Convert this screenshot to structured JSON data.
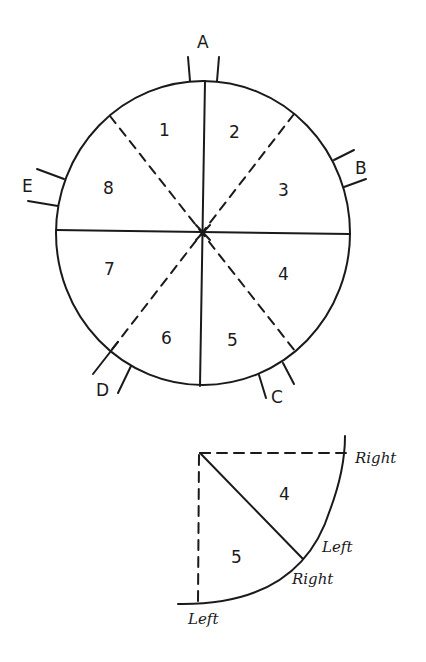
{
  "diagram": {
    "type": "sectored-circle",
    "main_circle": {
      "sectors": [
        {
          "id": "1",
          "label": "1"
        },
        {
          "id": "2",
          "label": "2"
        },
        {
          "id": "3",
          "label": "3"
        },
        {
          "id": "4",
          "label": "4"
        },
        {
          "id": "5",
          "label": "5"
        },
        {
          "id": "6",
          "label": "6"
        },
        {
          "id": "7",
          "label": "7"
        },
        {
          "id": "8",
          "label": "8"
        }
      ],
      "markers": [
        {
          "id": "A",
          "label": "A"
        },
        {
          "id": "B",
          "label": "B"
        },
        {
          "id": "C",
          "label": "C"
        },
        {
          "id": "D",
          "label": "D"
        },
        {
          "id": "E",
          "label": "E"
        }
      ],
      "solid_dividers": [
        "vertical",
        "horizontal"
      ],
      "dashed_dividers": [
        "diagonal-nw-se",
        "diagonal-ne-sw"
      ]
    },
    "detail_quadrant": {
      "sectors": [
        {
          "id": "4",
          "label": "4"
        },
        {
          "id": "5",
          "label": "5"
        }
      ],
      "edge_labels": {
        "top_right": "Right",
        "mid_left": "Left",
        "mid_right": "Right",
        "bottom_left": "Left"
      }
    },
    "colors": {
      "ink": "#1a1a1a",
      "background": "#ffffff"
    }
  }
}
